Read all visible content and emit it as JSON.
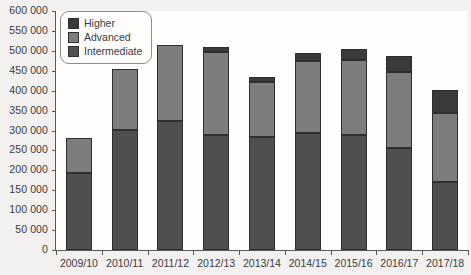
{
  "chart_data": {
    "type": "bar",
    "stacked": true,
    "title": "",
    "xlabel": "",
    "ylabel": "",
    "ylim": [
      0,
      600000
    ],
    "ytick_step": 50000,
    "ytick_labels": [
      "0",
      "50 000",
      "100 000",
      "150 000",
      "200 000",
      "250 000",
      "300 000",
      "350 000",
      "400 000",
      "450 000",
      "500 000",
      "550 000",
      "600 000"
    ],
    "ytick_values": [
      0,
      50000,
      100000,
      150000,
      200000,
      250000,
      300000,
      350000,
      400000,
      450000,
      500000,
      550000,
      600000
    ],
    "grid": false,
    "legend_position": "top-left",
    "categories": [
      "2009/10",
      "2010/11",
      "2011/12",
      "2012/13",
      "2013/14",
      "2014/15",
      "2015/16",
      "2016/17",
      "2017/18"
    ],
    "series": [
      {
        "name": "Intermediate",
        "color": "#4f4f50",
        "values": [
          193000,
          301000,
          324000,
          288000,
          283000,
          294000,
          288000,
          256000,
          170000
        ]
      },
      {
        "name": "Advanced",
        "color": "#7d7d7e",
        "values": [
          87000,
          154000,
          191000,
          209000,
          139000,
          181000,
          189000,
          192000,
          173000
        ]
      },
      {
        "name": "Higher",
        "color": "#3a3a3b",
        "values": [
          0,
          0,
          0,
          13000,
          13000,
          20000,
          28000,
          40000,
          58000
        ]
      }
    ],
    "totals": [
      280000,
      455000,
      515000,
      510000,
      435000,
      495000,
      505000,
      488000,
      401000
    ]
  },
  "legend": {
    "items": [
      {
        "label": "Higher",
        "color": "#3a3a3b"
      },
      {
        "label": "Advanced",
        "color": "#7d7d7e"
      },
      {
        "label": "Intermediate",
        "color": "#4f4f50"
      }
    ]
  },
  "colors": {
    "background": "#f2f1ef",
    "plot_background": "#fdfdfc",
    "axis": "#59585a",
    "text": "#3b3b3d",
    "bar_outline": "#2f2f30"
  }
}
